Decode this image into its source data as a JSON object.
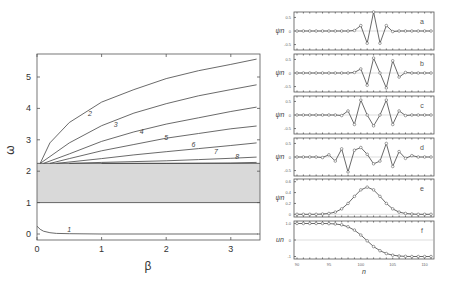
{
  "figure": {
    "left_panel": {
      "xlabel": "β",
      "ylabel": "ω",
      "xticks": [
        "0",
        "1",
        "2",
        "3"
      ],
      "yticks": [
        "0",
        "1",
        "2",
        "3",
        "4",
        "5"
      ],
      "curve_labels": [
        "1",
        "2",
        "3",
        "4",
        "5",
        "6",
        "7",
        "8"
      ]
    },
    "right_panels": {
      "xlabel": "n",
      "xticks": [
        "90",
        "95",
        "100",
        "105",
        "110"
      ],
      "panels": [
        {
          "label": "a",
          "ylabel": "ψn",
          "yticks": [
            "0.5",
            "0",
            "-0.5"
          ]
        },
        {
          "label": "b",
          "ylabel": "ψn",
          "yticks": [
            "0.5",
            "0",
            "-0.5"
          ]
        },
        {
          "label": "c",
          "ylabel": "ψn",
          "yticks": [
            "0.5",
            "0",
            "-0.5"
          ]
        },
        {
          "label": "d",
          "ylabel": "ψn",
          "yticks": [
            "0.5",
            "0",
            "-0.5"
          ]
        },
        {
          "label": "e",
          "ylabel": "ψn",
          "yticks": [
            "0.6",
            "0.4",
            "0.2",
            "0"
          ]
        },
        {
          "label": "f",
          "ylabel": "un",
          "yticks": [
            "1.0",
            "0",
            "-1"
          ]
        }
      ]
    }
  },
  "chart_data": [
    {
      "type": "line",
      "title": "",
      "xlabel": "β",
      "ylabel": "ω",
      "xlim": [
        0,
        3.45
      ],
      "ylim": [
        -0.1,
        5.75
      ],
      "grid": false,
      "shaded_band": {
        "ymin": 1.0,
        "ymax": 2.25,
        "color": "#d9d9d9"
      },
      "series": [
        {
          "name": "1",
          "x": [
            0,
            0.05,
            0.1,
            0.2,
            0.3,
            0.5,
            1,
            2,
            3,
            3.45
          ],
          "y": [
            0.25,
            0.15,
            0.09,
            0.04,
            0.02,
            0.01,
            0.0,
            0.0,
            0.0,
            0.0
          ]
        },
        {
          "name": "2",
          "x": [
            0.05,
            0.2,
            0.5,
            1,
            1.5,
            2,
            2.5,
            3,
            3.4
          ],
          "y": [
            2.25,
            2.9,
            3.55,
            4.2,
            4.6,
            4.95,
            5.2,
            5.4,
            5.57
          ]
        },
        {
          "name": "3",
          "x": [
            0.05,
            0.5,
            1,
            1.5,
            2,
            2.5,
            3,
            3.4
          ],
          "y": [
            2.25,
            2.9,
            3.45,
            3.85,
            4.15,
            4.4,
            4.6,
            4.75
          ]
        },
        {
          "name": "4",
          "x": [
            0.1,
            0.5,
            1,
            1.5,
            2,
            2.5,
            3,
            3.4
          ],
          "y": [
            2.25,
            2.55,
            2.95,
            3.25,
            3.5,
            3.7,
            3.9,
            4.04
          ]
        },
        {
          "name": "5",
          "x": [
            0.2,
            0.5,
            1,
            1.5,
            2,
            2.5,
            3,
            3.4
          ],
          "y": [
            2.25,
            2.4,
            2.65,
            2.85,
            3.05,
            3.2,
            3.35,
            3.44
          ]
        },
        {
          "name": "6",
          "x": [
            0.3,
            1,
            1.5,
            2,
            2.5,
            3,
            3.4
          ],
          "y": [
            2.25,
            2.4,
            2.52,
            2.62,
            2.72,
            2.82,
            2.9
          ]
        },
        {
          "name": "7",
          "x": [
            0.5,
            1,
            2,
            2.5,
            3,
            3.4
          ],
          "y": [
            2.25,
            2.28,
            2.33,
            2.37,
            2.41,
            2.45
          ]
        },
        {
          "name": "8",
          "x": [
            1,
            2,
            3,
            3.4
          ],
          "y": [
            2.25,
            2.25,
            2.26,
            2.28
          ]
        }
      ]
    },
    {
      "type": "line",
      "title": "a",
      "xlabel": "n",
      "ylabel": "ψn",
      "ylim": [
        -0.7,
        0.7
      ],
      "x": [
        90,
        91,
        92,
        93,
        94,
        95,
        96,
        97,
        98,
        99,
        100,
        101,
        102,
        103,
        104,
        105,
        106,
        107,
        108,
        109,
        110,
        111
      ],
      "values": [
        0,
        0,
        0,
        0,
        0,
        0,
        0,
        0,
        0,
        0.02,
        0.2,
        -0.45,
        0.7,
        -0.45,
        0.2,
        -0.02,
        0,
        0,
        0,
        0,
        0,
        0
      ]
    },
    {
      "type": "line",
      "title": "b",
      "xlabel": "n",
      "ylabel": "ψn",
      "ylim": [
        -0.7,
        0.7
      ],
      "x": [
        90,
        91,
        92,
        93,
        94,
        95,
        96,
        97,
        98,
        99,
        100,
        101,
        102,
        103,
        104,
        105,
        106,
        107,
        108,
        109,
        110,
        111
      ],
      "values": [
        0,
        0,
        0,
        0,
        0,
        0,
        0,
        0,
        0,
        0.02,
        0.15,
        -0.45,
        0.55,
        0,
        -0.55,
        0.45,
        -0.15,
        0.02,
        0,
        0,
        0,
        0
      ]
    },
    {
      "type": "line",
      "title": "c",
      "xlabel": "n",
      "ylabel": "ψn",
      "ylim": [
        -0.7,
        0.7
      ],
      "x": [
        90,
        91,
        92,
        93,
        94,
        95,
        96,
        97,
        98,
        99,
        100,
        101,
        102,
        103,
        104,
        105,
        106,
        107,
        108,
        109,
        110,
        111
      ],
      "values": [
        0,
        0,
        0,
        0,
        0,
        0,
        0,
        -0.02,
        0.15,
        -0.35,
        0.55,
        0,
        -0.4,
        0,
        0.55,
        -0.35,
        0.15,
        -0.02,
        0,
        0,
        0,
        0
      ]
    },
    {
      "type": "line",
      "title": "d",
      "xlabel": "n",
      "ylabel": "ψn",
      "ylim": [
        -0.7,
        0.7
      ],
      "x": [
        90,
        91,
        92,
        93,
        94,
        95,
        96,
        97,
        98,
        99,
        100,
        101,
        102,
        103,
        104,
        105,
        106,
        107,
        108,
        109,
        110,
        111
      ],
      "values": [
        0,
        0,
        0,
        0,
        -0.02,
        0.08,
        -0.15,
        0.3,
        -0.55,
        0.25,
        0.35,
        0.1,
        -0.25,
        -0.15,
        0.5,
        -0.35,
        0.2,
        -0.05,
        0.05,
        0,
        0,
        0
      ]
    },
    {
      "type": "line",
      "title": "e",
      "xlabel": "n",
      "ylabel": "ψn",
      "ylim": [
        -0.05,
        0.65
      ],
      "x": [
        90,
        91,
        92,
        93,
        94,
        95,
        96,
        97,
        98,
        99,
        100,
        101,
        102,
        103,
        104,
        105,
        106,
        107,
        108,
        109,
        110,
        111
      ],
      "values": [
        0,
        0,
        0,
        0,
        0.005,
        0.015,
        0.04,
        0.1,
        0.2,
        0.33,
        0.45,
        0.5,
        0.45,
        0.33,
        0.2,
        0.1,
        0.04,
        0.015,
        0.005,
        0,
        0,
        0
      ]
    },
    {
      "type": "line",
      "title": "f",
      "xlabel": "n",
      "ylabel": "un",
      "ylim": [
        -1.15,
        1.15
      ],
      "x": [
        90,
        91,
        92,
        93,
        94,
        95,
        96,
        97,
        98,
        99,
        100,
        101,
        102,
        103,
        104,
        105,
        106,
        107,
        108,
        109,
        110,
        111
      ],
      "values": [
        1,
        1,
        1,
        1,
        1,
        0.99,
        0.97,
        0.92,
        0.8,
        0.6,
        0.3,
        -0.05,
        -0.4,
        -0.65,
        -0.82,
        -0.92,
        -0.97,
        -0.99,
        -1,
        -1,
        -1,
        -1
      ]
    }
  ]
}
